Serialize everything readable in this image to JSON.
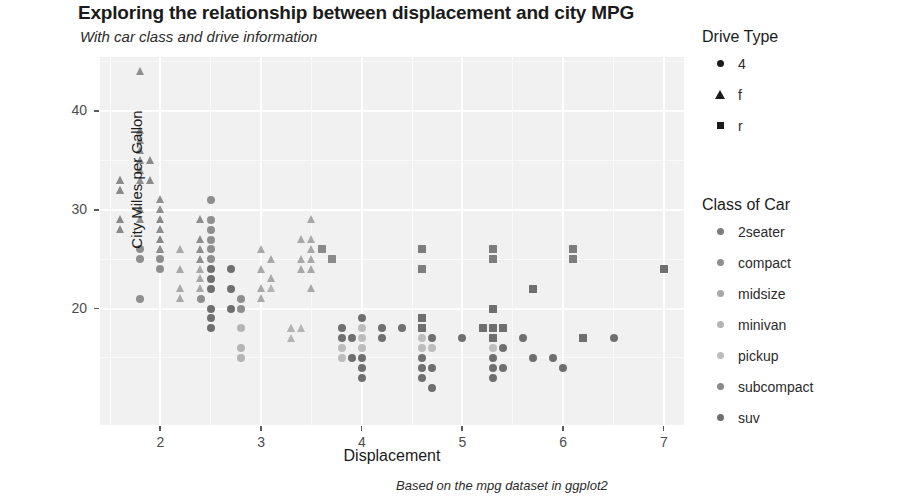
{
  "header": {
    "title": "Exploring the relationship between displacement and city MPG",
    "subtitle": "With car class and drive information",
    "caption": "Based on the mpg dataset in ggplot2"
  },
  "legends": {
    "drive": {
      "title": "Drive Type",
      "items": [
        {
          "label": "4",
          "shape": "circle"
        },
        {
          "label": "f",
          "shape": "triangle"
        },
        {
          "label": "r",
          "shape": "square"
        }
      ]
    },
    "car_class": {
      "title": "Class of Car",
      "items": [
        {
          "label": "2seater",
          "color": "#7d7d7d"
        },
        {
          "label": "compact",
          "color": "#8e8e8e"
        },
        {
          "label": "midsize",
          "color": "#a8a8a8"
        },
        {
          "label": "minivan",
          "color": "#b4b4b4"
        },
        {
          "label": "pickup",
          "color": "#bdbdbd"
        },
        {
          "label": "subcompact",
          "color": "#8a8a8a"
        },
        {
          "label": "suv",
          "color": "#6f6f6f"
        }
      ]
    }
  },
  "chart_data": {
    "type": "scatter",
    "title": "Exploring the relationship between displacement and city MPG",
    "subtitle": "With car class and drive information",
    "caption": "Based on the mpg dataset in ggplot2",
    "xlabel": "Displacement",
    "ylabel": "City Miles per Gallon",
    "xlim": [
      1.4,
      7.2
    ],
    "ylim": [
      8.2,
      45.5
    ],
    "xticks": [
      2,
      3,
      4,
      5,
      6,
      7
    ],
    "yticks": [
      20,
      30,
      40
    ],
    "grid": true,
    "legend_position": "right",
    "panel_background": "#f1f1f1",
    "shape_encoding": {
      "variable": "Drive Type",
      "4": "circle",
      "f": "triangle",
      "r": "square"
    },
    "color_encoding": {
      "variable": "Class of Car",
      "2seater": "#7d7d7d",
      "compact": "#8e8e8e",
      "midsize": "#a8a8a8",
      "minivan": "#b4b4b4",
      "pickup": "#bdbdbd",
      "subcompact": "#8a8a8a",
      "suv": "#6f6f6f"
    },
    "points": [
      {
        "x": 1.6,
        "y": 33,
        "drv": "f",
        "class": "subcompact"
      },
      {
        "x": 1.6,
        "y": 33,
        "drv": "f",
        "class": "subcompact"
      },
      {
        "x": 1.6,
        "y": 32,
        "drv": "f",
        "class": "subcompact"
      },
      {
        "x": 1.6,
        "y": 29,
        "drv": "f",
        "class": "subcompact"
      },
      {
        "x": 1.6,
        "y": 32,
        "drv": "f",
        "class": "subcompact"
      },
      {
        "x": 1.8,
        "y": 44,
        "drv": "f",
        "class": "compact"
      },
      {
        "x": 1.8,
        "y": 38,
        "drv": "f",
        "class": "compact"
      },
      {
        "x": 1.8,
        "y": 37,
        "drv": "f",
        "class": "compact"
      },
      {
        "x": 1.8,
        "y": 36,
        "drv": "f",
        "class": "compact"
      },
      {
        "x": 1.8,
        "y": 35,
        "drv": "f",
        "class": "compact"
      },
      {
        "x": 1.8,
        "y": 34,
        "drv": "f",
        "class": "compact"
      },
      {
        "x": 1.8,
        "y": 33,
        "drv": "f",
        "class": "compact"
      },
      {
        "x": 1.8,
        "y": 29,
        "drv": "f",
        "class": "compact"
      },
      {
        "x": 1.8,
        "y": 26,
        "drv": "4",
        "class": "compact"
      },
      {
        "x": 1.8,
        "y": 25,
        "drv": "4",
        "class": "compact"
      },
      {
        "x": 1.8,
        "y": 21,
        "drv": "4",
        "class": "compact"
      },
      {
        "x": 1.9,
        "y": 33,
        "drv": "f",
        "class": "subcompact"
      },
      {
        "x": 1.9,
        "y": 35,
        "drv": "f",
        "class": "subcompact"
      },
      {
        "x": 2.0,
        "y": 31,
        "drv": "f",
        "class": "compact"
      },
      {
        "x": 2.0,
        "y": 28,
        "drv": "f",
        "class": "compact"
      },
      {
        "x": 2.0,
        "y": 26,
        "drv": "f",
        "class": "compact"
      },
      {
        "x": 2.0,
        "y": 26,
        "drv": "f",
        "class": "compact"
      },
      {
        "x": 2.0,
        "y": 25,
        "drv": "4",
        "class": "compact"
      },
      {
        "x": 2.0,
        "y": 24,
        "drv": "4",
        "class": "compact"
      },
      {
        "x": 2.2,
        "y": 24,
        "drv": "f",
        "class": "midsize"
      },
      {
        "x": 2.2,
        "y": 22,
        "drv": "f",
        "class": "midsize"
      },
      {
        "x": 2.2,
        "y": 21,
        "drv": "f",
        "class": "midsize"
      },
      {
        "x": 2.4,
        "y": 29,
        "drv": "f",
        "class": "compact"
      },
      {
        "x": 2.4,
        "y": 27,
        "drv": "f",
        "class": "compact"
      },
      {
        "x": 2.4,
        "y": 26,
        "drv": "f",
        "class": "compact"
      },
      {
        "x": 2.4,
        "y": 25,
        "drv": "f",
        "class": "compact"
      },
      {
        "x": 2.4,
        "y": 24,
        "drv": "f",
        "class": "midsize"
      },
      {
        "x": 2.4,
        "y": 22,
        "drv": "f",
        "class": "midsize"
      },
      {
        "x": 2.4,
        "y": 21,
        "drv": "4",
        "class": "compact"
      },
      {
        "x": 2.5,
        "y": 31,
        "drv": "4",
        "class": "compact"
      },
      {
        "x": 2.5,
        "y": 29,
        "drv": "4",
        "class": "compact"
      },
      {
        "x": 2.5,
        "y": 28,
        "drv": "4",
        "class": "compact"
      },
      {
        "x": 2.5,
        "y": 27,
        "drv": "4",
        "class": "compact"
      },
      {
        "x": 2.5,
        "y": 26,
        "drv": "4",
        "class": "compact"
      },
      {
        "x": 2.5,
        "y": 25,
        "drv": "4",
        "class": "compact"
      },
      {
        "x": 2.5,
        "y": 24,
        "drv": "4",
        "class": "suv"
      },
      {
        "x": 2.5,
        "y": 23,
        "drv": "4",
        "class": "suv"
      },
      {
        "x": 2.5,
        "y": 20,
        "drv": "4",
        "class": "suv"
      },
      {
        "x": 2.5,
        "y": 18,
        "drv": "4",
        "class": "suv"
      },
      {
        "x": 2.7,
        "y": 24,
        "drv": "4",
        "class": "suv"
      },
      {
        "x": 2.7,
        "y": 22,
        "drv": "4",
        "class": "suv"
      },
      {
        "x": 2.7,
        "y": 20,
        "drv": "4",
        "class": "suv"
      },
      {
        "x": 2.8,
        "y": 21,
        "drv": "4",
        "class": "compact"
      },
      {
        "x": 2.8,
        "y": 20,
        "drv": "4",
        "class": "compact"
      },
      {
        "x": 2.8,
        "y": 18,
        "drv": "4",
        "class": "minivan"
      },
      {
        "x": 2.8,
        "y": 16,
        "drv": "4",
        "class": "minivan"
      },
      {
        "x": 3.0,
        "y": 26,
        "drv": "f",
        "class": "midsize"
      },
      {
        "x": 3.0,
        "y": 24,
        "drv": "f",
        "class": "midsize"
      },
      {
        "x": 3.0,
        "y": 22,
        "drv": "f",
        "class": "midsize"
      },
      {
        "x": 3.1,
        "y": 25,
        "drv": "f",
        "class": "midsize"
      },
      {
        "x": 3.1,
        "y": 23,
        "drv": "f",
        "class": "midsize"
      },
      {
        "x": 3.1,
        "y": 22,
        "drv": "f",
        "class": "minivan"
      },
      {
        "x": 3.3,
        "y": 18,
        "drv": "f",
        "class": "minivan"
      },
      {
        "x": 3.3,
        "y": 17,
        "drv": "f",
        "class": "minivan"
      },
      {
        "x": 3.4,
        "y": 27,
        "drv": "f",
        "class": "midsize"
      },
      {
        "x": 3.4,
        "y": 25,
        "drv": "f",
        "class": "midsize"
      },
      {
        "x": 3.4,
        "y": 24,
        "drv": "f",
        "class": "midsize"
      },
      {
        "x": 3.5,
        "y": 29,
        "drv": "f",
        "class": "midsize"
      },
      {
        "x": 3.5,
        "y": 27,
        "drv": "f",
        "class": "midsize"
      },
      {
        "x": 3.5,
        "y": 26,
        "drv": "f",
        "class": "midsize"
      },
      {
        "x": 3.5,
        "y": 25,
        "drv": "f",
        "class": "midsize"
      },
      {
        "x": 3.5,
        "y": 24,
        "drv": "f",
        "class": "midsize"
      },
      {
        "x": 3.6,
        "y": 26,
        "drv": "r",
        "class": "subcompact"
      },
      {
        "x": 3.7,
        "y": 25,
        "drv": "r",
        "class": "subcompact"
      },
      {
        "x": 3.8,
        "y": 18,
        "drv": "4",
        "class": "suv"
      },
      {
        "x": 3.8,
        "y": 17,
        "drv": "4",
        "class": "suv"
      },
      {
        "x": 3.8,
        "y": 16,
        "drv": "4",
        "class": "pickup"
      },
      {
        "x": 3.9,
        "y": 17,
        "drv": "4",
        "class": "suv"
      },
      {
        "x": 3.9,
        "y": 15,
        "drv": "4",
        "class": "suv"
      },
      {
        "x": 4.0,
        "y": 18,
        "drv": "4",
        "class": "pickup"
      },
      {
        "x": 4.0,
        "y": 17,
        "drv": "4",
        "class": "pickup"
      },
      {
        "x": 4.0,
        "y": 16,
        "drv": "4",
        "class": "pickup"
      },
      {
        "x": 4.0,
        "y": 15,
        "drv": "4",
        "class": "suv"
      },
      {
        "x": 4.0,
        "y": 14,
        "drv": "4",
        "class": "suv"
      },
      {
        "x": 4.2,
        "y": 17,
        "drv": "4",
        "class": "suv"
      },
      {
        "x": 4.2,
        "y": 18,
        "drv": "4",
        "class": "suv"
      },
      {
        "x": 4.4,
        "y": 18,
        "drv": "4",
        "class": "suv"
      },
      {
        "x": 4.6,
        "y": 26,
        "drv": "r",
        "class": "2seater"
      },
      {
        "x": 4.6,
        "y": 24,
        "drv": "r",
        "class": "2seater"
      },
      {
        "x": 4.6,
        "y": 19,
        "drv": "r",
        "class": "suv"
      },
      {
        "x": 4.6,
        "y": 18,
        "drv": "r",
        "class": "suv"
      },
      {
        "x": 4.6,
        "y": 16,
        "drv": "4",
        "class": "pickup"
      },
      {
        "x": 4.6,
        "y": 15,
        "drv": "4",
        "class": "suv"
      },
      {
        "x": 4.6,
        "y": 14,
        "drv": "4",
        "class": "suv"
      },
      {
        "x": 4.7,
        "y": 17,
        "drv": "4",
        "class": "suv"
      },
      {
        "x": 4.7,
        "y": 16,
        "drv": "4",
        "class": "pickup"
      },
      {
        "x": 4.7,
        "y": 12,
        "drv": "4",
        "class": "suv"
      },
      {
        "x": 5.0,
        "y": 17,
        "drv": "4",
        "class": "suv"
      },
      {
        "x": 5.2,
        "y": 18,
        "drv": "r",
        "class": "suv"
      },
      {
        "x": 5.3,
        "y": 26,
        "drv": "r",
        "class": "2seater"
      },
      {
        "x": 5.3,
        "y": 25,
        "drv": "r",
        "class": "2seater"
      },
      {
        "x": 5.3,
        "y": 20,
        "drv": "r",
        "class": "suv"
      },
      {
        "x": 5.3,
        "y": 18,
        "drv": "r",
        "class": "suv"
      },
      {
        "x": 5.3,
        "y": 17,
        "drv": "r",
        "class": "suv"
      },
      {
        "x": 5.3,
        "y": 16,
        "drv": "4",
        "class": "pickup"
      },
      {
        "x": 5.3,
        "y": 15,
        "drv": "4",
        "class": "suv"
      },
      {
        "x": 5.4,
        "y": 18,
        "drv": "r",
        "class": "suv"
      },
      {
        "x": 5.4,
        "y": 16,
        "drv": "4",
        "class": "suv"
      },
      {
        "x": 5.4,
        "y": 14,
        "drv": "4",
        "class": "suv"
      },
      {
        "x": 5.6,
        "y": 17,
        "drv": "4",
        "class": "suv"
      },
      {
        "x": 5.7,
        "y": 15,
        "drv": "4",
        "class": "suv"
      },
      {
        "x": 5.7,
        "y": 22,
        "drv": "r",
        "class": "suv"
      },
      {
        "x": 5.9,
        "y": 15,
        "drv": "4",
        "class": "suv"
      },
      {
        "x": 6.0,
        "y": 14,
        "drv": "4",
        "class": "suv"
      },
      {
        "x": 6.1,
        "y": 26,
        "drv": "r",
        "class": "2seater"
      },
      {
        "x": 6.1,
        "y": 25,
        "drv": "r",
        "class": "2seater"
      },
      {
        "x": 6.2,
        "y": 17,
        "drv": "r",
        "class": "suv"
      },
      {
        "x": 6.5,
        "y": 17,
        "drv": "4",
        "class": "suv"
      },
      {
        "x": 7.0,
        "y": 24,
        "drv": "r",
        "class": "suv"
      },
      {
        "x": 1.8,
        "y": 30,
        "drv": "f",
        "class": "compact"
      },
      {
        "x": 2.0,
        "y": 30,
        "drv": "f",
        "class": "compact"
      },
      {
        "x": 2.0,
        "y": 29,
        "drv": "f",
        "class": "subcompact"
      },
      {
        "x": 2.2,
        "y": 26,
        "drv": "f",
        "class": "midsize"
      },
      {
        "x": 2.4,
        "y": 23,
        "drv": "f",
        "class": "midsize"
      },
      {
        "x": 2.5,
        "y": 22,
        "drv": "4",
        "class": "suv"
      },
      {
        "x": 3.0,
        "y": 21,
        "drv": "f",
        "class": "midsize"
      },
      {
        "x": 3.3,
        "y": 18,
        "drv": "f",
        "class": "minivan"
      },
      {
        "x": 3.5,
        "y": 22,
        "drv": "f",
        "class": "midsize"
      },
      {
        "x": 4.0,
        "y": 19,
        "drv": "4",
        "class": "suv"
      },
      {
        "x": 4.7,
        "y": 14,
        "drv": "4",
        "class": "suv"
      },
      {
        "x": 5.3,
        "y": 14,
        "drv": "4",
        "class": "suv"
      },
      {
        "x": 1.6,
        "y": 28,
        "drv": "f",
        "class": "subcompact"
      },
      {
        "x": 2.0,
        "y": 27,
        "drv": "f",
        "class": "subcompact"
      },
      {
        "x": 2.5,
        "y": 19,
        "drv": "4",
        "class": "suv"
      },
      {
        "x": 3.8,
        "y": 15,
        "drv": "4",
        "class": "pickup"
      },
      {
        "x": 4.0,
        "y": 13,
        "drv": "4",
        "class": "suv"
      },
      {
        "x": 4.6,
        "y": 17,
        "drv": "4",
        "class": "pickup"
      },
      {
        "x": 4.6,
        "y": 13,
        "drv": "4",
        "class": "suv"
      },
      {
        "x": 5.3,
        "y": 13,
        "drv": "4",
        "class": "suv"
      },
      {
        "x": 2.8,
        "y": 15,
        "drv": "4",
        "class": "minivan"
      },
      {
        "x": 3.4,
        "y": 18,
        "drv": "f",
        "class": "minivan"
      }
    ]
  }
}
